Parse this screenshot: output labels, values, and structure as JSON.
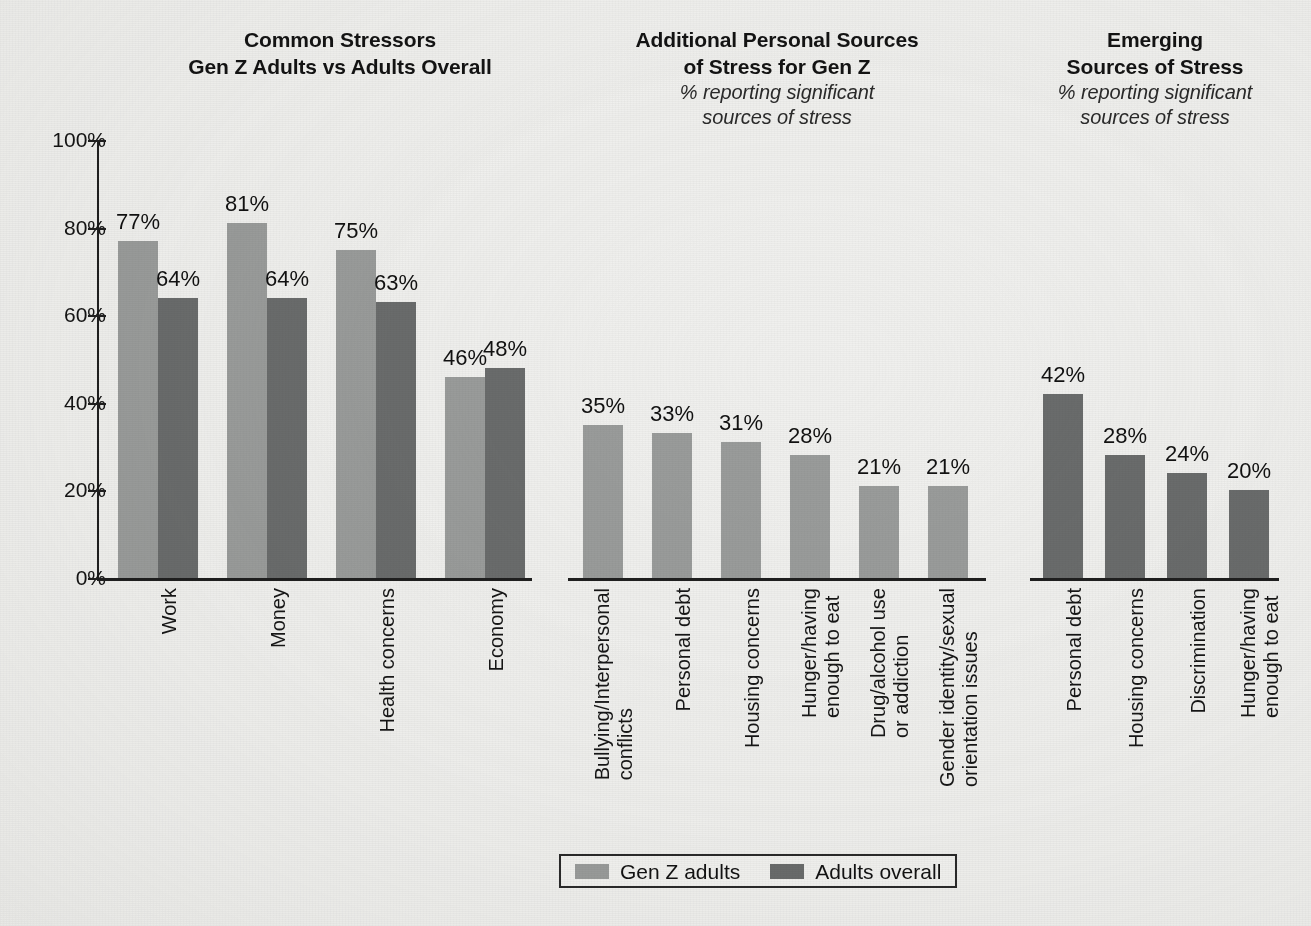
{
  "figure": {
    "background_color": "#f0f0ee",
    "axis_color": "#1f1f1f",
    "series_colors": {
      "gen_z": "#9a9c9b",
      "adults_overall": "#6a6c6c"
    }
  },
  "y_axis": {
    "ticks": [
      "100%",
      "80%",
      "60%",
      "40%",
      "20%",
      "0%"
    ],
    "min": 0,
    "max": 100
  },
  "legend": {
    "position": "bottom-center",
    "items": [
      {
        "label": "Gen Z adults",
        "color": "#9a9c9b"
      },
      {
        "label": "Adults overall",
        "color": "#6a6c6c"
      }
    ]
  },
  "panels": [
    {
      "id": "common-stressors",
      "title_line1": "Common Stressors",
      "title_line2": "Gen Z Adults vs Adults Overall",
      "subtitle": ""
    },
    {
      "id": "additional-personal-sources",
      "title_line1": "Additional Personal Sources",
      "title_line2": "of Stress for Gen Z",
      "subtitle_line1": "% reporting significant",
      "subtitle_line2": "sources of stress"
    },
    {
      "id": "emerging-sources",
      "title_line1": "Emerging",
      "title_line2": "Sources of Stress",
      "subtitle_line1": "% reporting significant",
      "subtitle_line2": "sources of stress"
    }
  ],
  "chart_data": [
    {
      "type": "bar",
      "title": "Common Stressors — Gen Z Adults vs Adults Overall",
      "xlabel": "",
      "ylabel": "",
      "ylim": [
        0,
        100
      ],
      "grid": false,
      "legend_position": "bottom-center",
      "categories": [
        "Work",
        "Money",
        "Health concerns",
        "Economy"
      ],
      "series": [
        {
          "name": "Gen Z adults",
          "color": "#9a9c9b",
          "values": [
            77,
            81,
            75,
            46
          ],
          "labels": [
            "77%",
            "81%",
            "75%",
            "46%"
          ]
        },
        {
          "name": "Adults overall",
          "color": "#6a6c6c",
          "values": [
            64,
            64,
            63,
            48
          ],
          "labels": [
            "64%",
            "64%",
            "63%",
            "48%"
          ]
        }
      ]
    },
    {
      "type": "bar",
      "title": "Additional Personal Sources of Stress for Gen Z",
      "subtitle": "% reporting significant sources of stress",
      "xlabel": "",
      "ylabel": "",
      "ylim": [
        0,
        100
      ],
      "grid": false,
      "categories": [
        "Bullying/Interpersonal\nconflicts",
        "Personal debt",
        "Housing concerns",
        "Hunger/having\nenough to eat",
        "Drug/alcohol use\nor addiction",
        "Gender identity/sexual\norientation issues"
      ],
      "series": [
        {
          "name": "Gen Z adults",
          "color": "#9a9c9b",
          "values": [
            35,
            33,
            31,
            28,
            21,
            21
          ],
          "labels": [
            "35%",
            "33%",
            "31%",
            "28%",
            "21%",
            "21%"
          ]
        }
      ]
    },
    {
      "type": "bar",
      "title": "Emerging Sources of Stress",
      "subtitle": "% reporting significant sources of stress",
      "xlabel": "",
      "ylabel": "",
      "ylim": [
        0,
        100
      ],
      "grid": false,
      "categories": [
        "Personal debt",
        "Housing concerns",
        "Discrimination",
        "Hunger/having\nenough to eat"
      ],
      "series": [
        {
          "name": "Adults overall",
          "color": "#6a6c6c",
          "values": [
            42,
            28,
            24,
            20
          ],
          "labels": [
            "42%",
            "28%",
            "24%",
            "20%"
          ]
        }
      ]
    }
  ]
}
